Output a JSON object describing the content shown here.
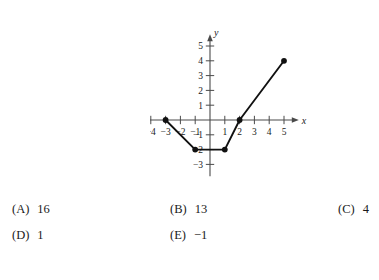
{
  "top_sliver": {
    "text": ""
  },
  "chart_data": {
    "type": "line",
    "title": "",
    "subtitle": "",
    "xlabel": "x",
    "ylabel": "y",
    "xlim": [
      -5.8,
      6.0
    ],
    "ylim": [
      -3.8,
      5.8
    ],
    "grid": false,
    "legend": "none",
    "x_ticks": [
      -5,
      -4,
      -3,
      -2,
      -1,
      1,
      2,
      3,
      4,
      5
    ],
    "x_tick_labels": [
      "-5",
      "-4",
      "-3",
      "-2",
      "-1",
      "1",
      "2",
      "3",
      "4",
      "5"
    ],
    "y_ticks": [
      -3,
      -2,
      -1,
      1,
      2,
      3,
      4,
      5
    ],
    "y_tick_labels": [
      "-3",
      "-2",
      "-1",
      "1",
      "2",
      "3",
      "4",
      "5"
    ],
    "series": [
      {
        "name": "piecewise-linear-graph",
        "marker": "filled-circle",
        "points": [
          {
            "x": -3,
            "y": 0
          },
          {
            "x": -1,
            "y": -2
          },
          {
            "x": 1,
            "y": -2
          },
          {
            "x": 2,
            "y": 0
          },
          {
            "x": 5,
            "y": 4
          }
        ]
      }
    ],
    "endpoint_markers": [
      {
        "x": -3,
        "y": 0
      },
      {
        "x": -1,
        "y": -2
      },
      {
        "x": 1,
        "y": -2
      },
      {
        "x": 2,
        "y": 0
      },
      {
        "x": 5,
        "y": 4
      }
    ],
    "axis_color": "#4a4a4a",
    "curve_color": "#111111"
  },
  "choices": [
    {
      "key": "A",
      "label": "(A)",
      "value": "16"
    },
    {
      "key": "B",
      "label": "(B)",
      "value": "13"
    },
    {
      "key": "C",
      "label": "(C)",
      "value": "4"
    },
    {
      "key": "D",
      "label": "(D)",
      "value": "1"
    },
    {
      "key": "E",
      "label": "(E)",
      "value": "−1"
    }
  ]
}
